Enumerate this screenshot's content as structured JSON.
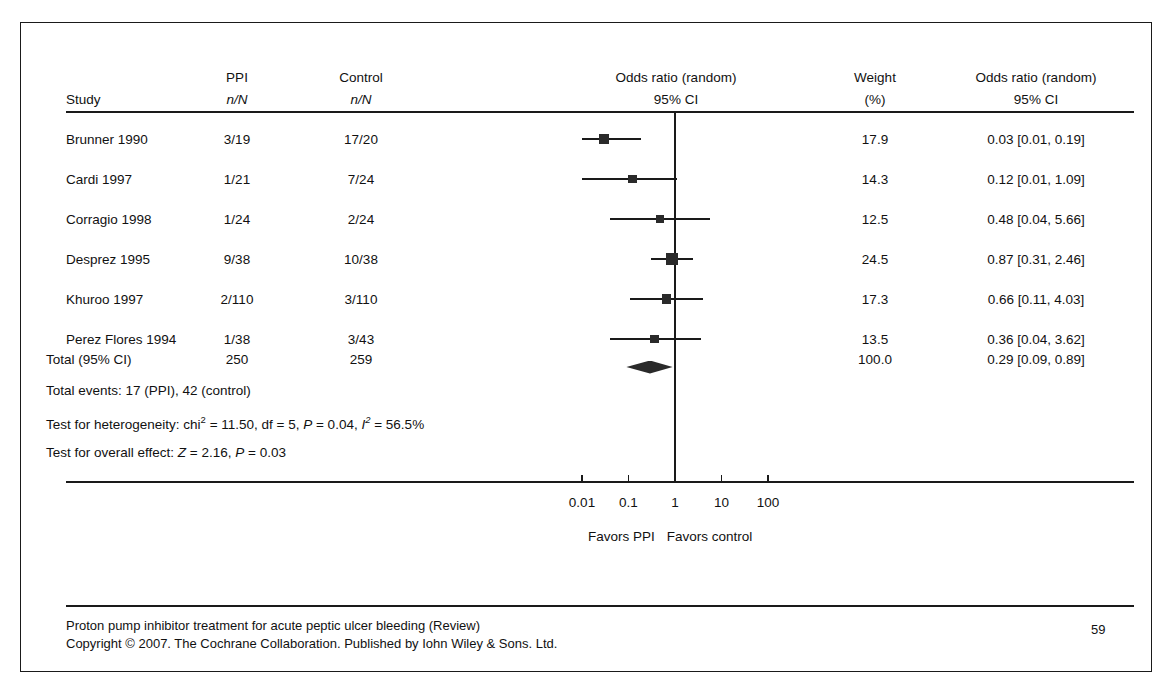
{
  "document": {
    "page_number": "59",
    "footer_line1": "Proton pump inhibitor treatment for acute peptic ulcer bleeding (Review)",
    "footer_line2": "Copyright © 2007. The Cochrane Collaboration. Published by Iohn Wiley & Sons. Ltd."
  },
  "table": {
    "headers": {
      "study": "Study",
      "ppi_top": "PPI",
      "ppi_sub": "n/N",
      "control_top": "Control",
      "control_sub": "n/N",
      "plot_top": "Odds ratio (random)",
      "plot_sub": "95% CI",
      "weight_top": "Weight",
      "weight_sub": "(%)",
      "or_top": "Odds ratio (random)",
      "or_sub": "95% CI"
    },
    "rows": [
      {
        "study": "Brunner 1990",
        "ppi": "3/19",
        "control": "17/20",
        "weight": "17.9",
        "or_text": "0.03 [0.01, 0.19]"
      },
      {
        "study": "Cardi 1997",
        "ppi": "1/21",
        "control": "7/24",
        "weight": "14.3",
        "or_text": "0.12 [0.01, 1.09]"
      },
      {
        "study": "Corragio 1998",
        "ppi": "1/24",
        "control": "2/24",
        "weight": "12.5",
        "or_text": "0.48 [0.04, 5.66]"
      },
      {
        "study": "Desprez 1995",
        "ppi": "9/38",
        "control": "10/38",
        "weight": "24.5",
        "or_text": "0.87 [0.31, 2.46]"
      },
      {
        "study": "Khuroo 1997",
        "ppi": "2/110",
        "control": "3/110",
        "weight": "17.3",
        "or_text": "0.66 [0.11, 4.03]"
      },
      {
        "study": "Perez Flores 1994",
        "ppi": "1/38",
        "control": "3/43",
        "weight": "13.5",
        "or_text": "0.36 [0.04, 3.62]"
      }
    ],
    "total_row": {
      "label": "Total (95% CI)",
      "ppi": "250",
      "control": "259",
      "weight": "100.0",
      "or_text": "0.29 [0.09, 0.89]"
    }
  },
  "statistics": {
    "total_events": "Total events: 17 (PPI), 42 (control)",
    "heterogeneity_prefix": "Test for heterogeneity: chi",
    "heterogeneity_sup": "2",
    "heterogeneity_mid": " = 11.50, df = 5, ",
    "heterogeneity_p_italic": "P",
    "heterogeneity_p_rest": " = 0.04, ",
    "heterogeneity_i_italic": "I",
    "heterogeneity_i_sup": "2",
    "heterogeneity_i_rest": " = 56.5%",
    "overall_prefix": "Test for overall effect: ",
    "overall_z_italic": "Z",
    "overall_z_rest": " = 2.16, ",
    "overall_p_italic": "P",
    "overall_p_rest": " = 0.03"
  },
  "axis": {
    "ticks": [
      "0.01",
      "0.1",
      "1",
      "10",
      "100"
    ],
    "tick_values": [
      0.01,
      0.1,
      1,
      10,
      100
    ],
    "favors_left": "Favors PPI",
    "favors_right": "Favors control"
  },
  "colors": {
    "ink": "#1a1a1a",
    "marker": "#2a2a2a",
    "background": "#ffffff"
  },
  "chart_data": {
    "type": "forest",
    "title": "Odds ratio (random) 95% CI",
    "xlabel": "Odds ratio",
    "xscale": "log",
    "xlim": [
      0.004,
      300
    ],
    "reference_line": 1,
    "xticks": [
      0.01,
      0.1,
      1,
      10,
      100
    ],
    "xticklabels": [
      "0.01",
      "0.1",
      "1",
      "10",
      "100"
    ],
    "left_annotation": "Favors PPI",
    "right_annotation": "Favors control",
    "grid": false,
    "legend": "none",
    "studies": [
      {
        "name": "Brunner 1990",
        "ppi_events": 3,
        "ppi_total": 19,
        "control_events": 17,
        "control_total": 20,
        "weight_pct": 17.9,
        "or": 0.03,
        "ci_low": 0.01,
        "ci_high": 0.19
      },
      {
        "name": "Cardi 1997",
        "ppi_events": 1,
        "ppi_total": 21,
        "control_events": 7,
        "control_total": 24,
        "weight_pct": 14.3,
        "or": 0.12,
        "ci_low": 0.01,
        "ci_high": 1.09
      },
      {
        "name": "Corragio 1998",
        "ppi_events": 1,
        "ppi_total": 24,
        "control_events": 2,
        "control_total": 24,
        "weight_pct": 12.5,
        "or": 0.48,
        "ci_low": 0.04,
        "ci_high": 5.66
      },
      {
        "name": "Desprez 1995",
        "ppi_events": 9,
        "ppi_total": 38,
        "control_events": 10,
        "control_total": 38,
        "weight_pct": 24.5,
        "or": 0.87,
        "ci_low": 0.31,
        "ci_high": 2.46
      },
      {
        "name": "Khuroo 1997",
        "ppi_events": 2,
        "ppi_total": 110,
        "control_events": 3,
        "control_total": 110,
        "weight_pct": 17.3,
        "or": 0.66,
        "ci_low": 0.11,
        "ci_high": 4.03
      },
      {
        "name": "Perez Flores 1994",
        "ppi_events": 1,
        "ppi_total": 38,
        "control_events": 3,
        "control_total": 43,
        "weight_pct": 13.5,
        "or": 0.36,
        "ci_low": 0.04,
        "ci_high": 3.62
      }
    ],
    "pooled": {
      "name": "Total (95% CI)",
      "ppi_total": 250,
      "control_total": 259,
      "ppi_events": 17,
      "control_events": 42,
      "weight_pct": 100.0,
      "or": 0.29,
      "ci_low": 0.09,
      "ci_high": 0.89
    },
    "heterogeneity": {
      "chi2": 11.5,
      "df": 5,
      "p": 0.04,
      "i2_pct": 56.5
    },
    "overall_effect": {
      "z": 2.16,
      "p": 0.03
    }
  }
}
